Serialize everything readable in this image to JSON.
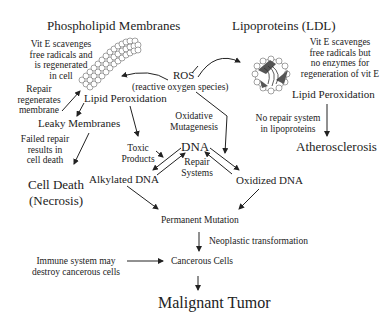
{
  "titles": {
    "phospholipid": "Phospholipid Membranes",
    "lipoproteins": "Lipoproteins (LDL)"
  },
  "left": {
    "vit_e_note": [
      "Vit E scavenges",
      "free radicals and",
      "is regenerated",
      "in cell"
    ],
    "repair_note": [
      "Repair",
      "regenerates",
      "membrane"
    ],
    "lipid_peroxidation": "Lipid Peroxidation",
    "leaky_membranes": "Leaky Membranes",
    "failed_repair_note": [
      "Failed repair",
      "results in",
      "cell death"
    ],
    "cell_death": [
      "Cell Death",
      "(Necrosis)"
    ]
  },
  "center": {
    "ros": "ROS",
    "ros_full": "(reactive oxygen species)",
    "oxidative_mutagenesis": [
      "Oxidative",
      "Mutagenesis"
    ],
    "toxic_products": [
      "Toxic",
      "Products"
    ],
    "dna": "DNA",
    "repair_systems": [
      "Repair",
      "Systems"
    ],
    "alkylated_dna": "Alkylated DNA",
    "oxidized_dna": "Oxidized DNA"
  },
  "right": {
    "vit_e_note": [
      "Vit E scavenges",
      "free radicals but",
      "no enzymes for",
      "regeneration of vit E"
    ],
    "lipid_peroxidation": "Lipid Peroxidation",
    "no_repair_note": [
      "No repair system",
      "in lipoproteins"
    ],
    "atherosclerosis": "Atherosclerosis"
  },
  "bottom": {
    "permanent_mutation": "Permanent Mutation",
    "neoplastic_transformation": "Neoplastic transformation",
    "immune_note": [
      "Immune system may",
      "destroy cancerous cells"
    ],
    "cancerous_cells": "Cancerous Cells",
    "malignant_tumor": "Malignant Tumor"
  },
  "colors": {
    "text": "#222222",
    "arrow": "#222222",
    "membrane_fill": "#ffffff",
    "membrane_stroke": "#555555",
    "protein_fill": "#555555"
  }
}
